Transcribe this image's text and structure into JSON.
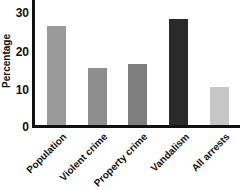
{
  "chart_data": {
    "type": "bar",
    "title": "",
    "xlabel": "",
    "ylabel": "Percentage",
    "ylim": [
      0,
      33
    ],
    "yticks": [
      0,
      10,
      20,
      30
    ],
    "grid": false,
    "legend": null,
    "categories": [
      "Population",
      "Violent crime",
      "Property crime",
      "Vandalism",
      "All arrests"
    ],
    "values": [
      26,
      15,
      16,
      28,
      10
    ],
    "colors": [
      "#9a9a9a",
      "#8e8e8e",
      "#7e7e7e",
      "#2a2a2a",
      "#c6c6c6"
    ]
  },
  "axis": {
    "ylabel": "Percentage",
    "yticks": [
      "0",
      "10",
      "20",
      "30"
    ]
  },
  "bars": [
    {
      "label": "Population",
      "value": 26,
      "color": "#9a9a9a"
    },
    {
      "label": "Violent crime",
      "value": 15,
      "color": "#8e8e8e"
    },
    {
      "label": "Property crime",
      "value": 16,
      "color": "#7e7e7e"
    },
    {
      "label": "Vandalism",
      "value": 28,
      "color": "#2a2a2a"
    },
    {
      "label": "All arrests",
      "value": 10,
      "color": "#c6c6c6"
    }
  ]
}
